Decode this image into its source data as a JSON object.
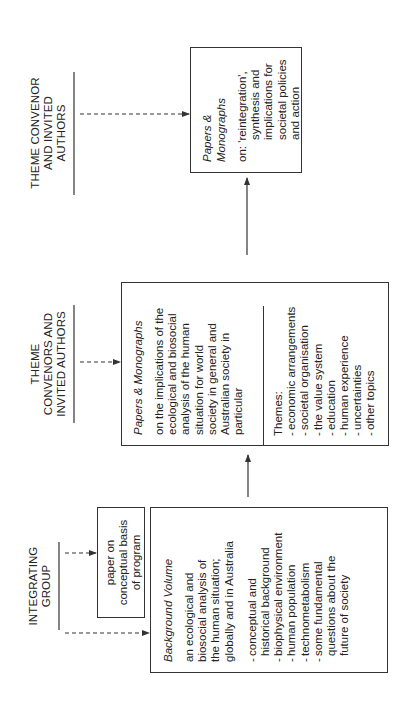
{
  "diagram": {
    "orientation": "rotated 90° counter-clockwise",
    "groups": [
      {
        "id": "integrating",
        "label_lines": [
          "INTEGRATING",
          "GROUP"
        ]
      },
      {
        "id": "theme_convenors",
        "label_lines": [
          "THEME",
          "CONVENORS AND",
          "INVITED AUTHORS"
        ]
      },
      {
        "id": "theme_convenor",
        "label_lines": [
          "THEME CONVENOR",
          "AND INVITED",
          "AUTHORS"
        ]
      }
    ],
    "boxes": {
      "paper": {
        "lines": [
          "paper on",
          "conceptual basis",
          "of program"
        ]
      },
      "background": {
        "title": "Background Volume",
        "lines": [
          "an ecological and",
          "biosocial analysis of",
          "the human situation;",
          "globally and in Australia"
        ],
        "items": [
          [
            "conceptual and",
            "historical background"
          ],
          [
            "biophysical environment"
          ],
          [
            "human population"
          ],
          [
            "technometabolism"
          ],
          [
            "some fundamental",
            "questions about the",
            "future of society"
          ]
        ]
      },
      "papers_mid": {
        "title": "Papers & Monographs",
        "lines": [
          "on the implications of the",
          "ecological and biosocial",
          "analysis of the human",
          "situation for world",
          "society in general and",
          "Australian society in",
          "particular"
        ],
        "themes_label": "Themes:",
        "themes": [
          "economic arrangements",
          "societal organisation",
          "the value system",
          "education",
          "human experience",
          "uncertainties",
          "other topics"
        ]
      },
      "papers_top": {
        "title": "Papers & Monographs",
        "lines": [
          "on: 'reintegration',",
          "synthesis and",
          "implications for",
          "societal policies",
          "and action"
        ]
      }
    },
    "connectors": [
      {
        "from": "integrating",
        "to": "paper",
        "style": "dashed-arrow"
      },
      {
        "from": "integrating",
        "to": "background",
        "style": "dashed-arrow"
      },
      {
        "from": "theme_convenors",
        "to": "papers_mid",
        "style": "dashed-arrow"
      },
      {
        "from": "theme_convenor",
        "to": "papers_top",
        "style": "dashed-arrow"
      },
      {
        "from": "background",
        "to": "papers_mid",
        "style": "solid-arrow"
      },
      {
        "from": "papers_mid",
        "to": "papers_top",
        "style": "solid-arrow"
      }
    ],
    "colors": {
      "line": "#333333",
      "text": "#222222",
      "background": "#ffffff"
    }
  }
}
